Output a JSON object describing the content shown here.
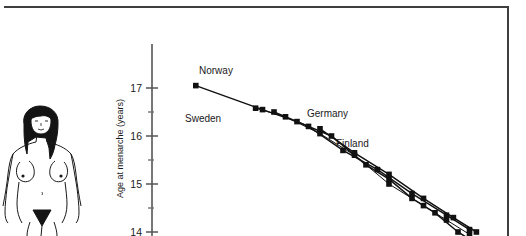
{
  "figure": {
    "frame_color": "#3f3f3f",
    "background": "#ffffff",
    "illustration": {
      "name": "adult-female-anatomy-illustration",
      "description": "line drawing of standing adult female figure",
      "skin_color": "#ffffff",
      "line_color": "#1a1a1a",
      "hair_color": "#141414"
    }
  },
  "chart_data": {
    "type": "line",
    "title": "",
    "subtitle": "",
    "xlabel": "",
    "ylabel": "Age at menarche (years)",
    "ylim": [
      13.6,
      17.45
    ],
    "xlim": [
      1840,
      1980
    ],
    "yticks_major": [
      17,
      16,
      15,
      14
    ],
    "yticks_minor": [
      16.5,
      15.5,
      14.5
    ],
    "grid": false,
    "legend": "inline-annotations",
    "marker": "filled-square",
    "marker_color": "#111111",
    "line_color": "#111111",
    "series": [
      {
        "name": "Norway",
        "label": "Norway",
        "x": [
          1846,
          1875,
          1890,
          1905,
          1920,
          1930,
          1940,
          1950,
          1960,
          1970
        ],
        "values": [
          17.05,
          16.55,
          16.3,
          16.0,
          15.4,
          15.1,
          14.7,
          14.4,
          14.0,
          13.7
        ]
      },
      {
        "name": "Sweden",
        "label": "Sweden",
        "x": [
          1872,
          1885,
          1900,
          1915,
          1930,
          1945,
          1955,
          1965
        ],
        "values": [
          16.58,
          16.4,
          16.05,
          15.6,
          15.0,
          14.55,
          14.25,
          13.95
        ]
      },
      {
        "name": "Germany",
        "label": "Germany",
        "x": [
          1880,
          1895,
          1910,
          1925,
          1940,
          1955,
          1965
        ],
        "values": [
          16.5,
          16.2,
          15.7,
          15.3,
          14.8,
          14.35,
          14.05
        ]
      },
      {
        "name": "Finland",
        "label": "Finland",
        "x": [
          1900,
          1915,
          1930,
          1945,
          1958,
          1968
        ],
        "values": [
          16.15,
          15.65,
          15.2,
          14.7,
          14.3,
          14.0
        ]
      }
    ],
    "annotations": [
      {
        "text": "Norway",
        "x_px": 199,
        "y_px": 74
      },
      {
        "text": "Sweden",
        "x_px": 185,
        "y_px": 122
      },
      {
        "text": "Germany",
        "x_px": 307,
        "y_px": 117
      },
      {
        "text": "Finland",
        "x_px": 336,
        "y_px": 147
      }
    ]
  }
}
